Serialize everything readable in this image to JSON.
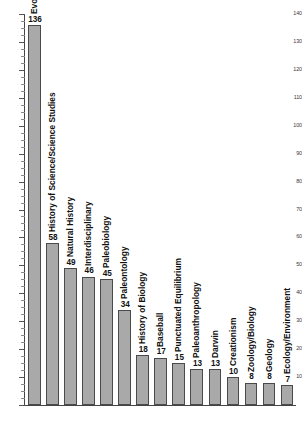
{
  "chart_data": {
    "type": "bar",
    "title": "",
    "subtitle": "",
    "xlabel": "",
    "ylabel": "",
    "ylim": [
      0,
      140
    ],
    "grid": false,
    "legend": null,
    "orientation": "vertical",
    "bar_color": "#a9a9a9",
    "bar_edge_color": "#4a4a4a",
    "y_ticks": [
      0,
      10,
      20,
      30,
      40,
      50,
      60,
      70,
      80,
      90,
      100,
      110,
      120,
      130,
      140
    ],
    "y_tick_labels": [
      "",
      "10",
      "20",
      "30",
      "40",
      "50",
      "60",
      "70",
      "80",
      "90",
      "100",
      "110",
      "120",
      "130",
      "140"
    ],
    "y_minor_tick_interval": 2.5,
    "categories": [
      "Evolutionary Theory",
      "History of Science/Science Studies",
      "Natural History",
      "Interdisciplinary",
      "Paleobiology",
      "Paleontology",
      "History of Biology",
      "Baseball",
      "Punctuated Equilibrium",
      "Paleoanthropology",
      "Darwin",
      "Creationism",
      "Zoology/Biology",
      "Geology",
      "Ecology/Environment"
    ],
    "values": [
      136,
      58,
      49,
      46,
      45,
      34,
      18,
      17,
      15,
      13,
      13,
      10,
      8,
      8,
      7
    ],
    "data_labels": [
      "136",
      "58",
      "49",
      "46",
      "45",
      "34",
      "18",
      "17",
      "15",
      "13",
      "13",
      "10",
      "8",
      "8",
      "7"
    ]
  }
}
